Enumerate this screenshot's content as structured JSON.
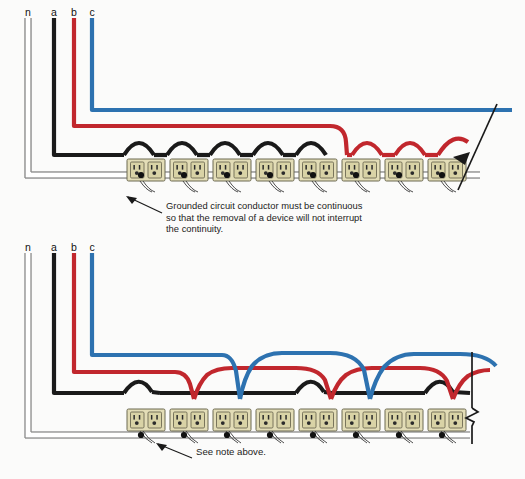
{
  "figure": {
    "background_color": "#fbfbfa"
  },
  "colors": {
    "phase_a_black": "#1a1a1a",
    "phase_b_red": "#c1272d",
    "phase_c_blue": "#2d72b0",
    "neutral_white": "#ffffff",
    "neutral_outline": "#8e8e8e",
    "receptacle_body": "#e3ddb7",
    "receptacle_outline": "#6d6a52",
    "receptacle_face": "#d8d2a4",
    "text": "#1b1b1b"
  },
  "conductor_labels": [
    {
      "id": "n",
      "label": "n",
      "name": "neutral",
      "color": "#ffffff"
    },
    {
      "id": "a",
      "label": "a",
      "name": "phase-a",
      "color": "#1a1a1a"
    },
    {
      "id": "b",
      "label": "b",
      "name": "phase-b",
      "color": "#c1272d"
    },
    {
      "id": "c",
      "label": "c",
      "name": "phase-c",
      "color": "#2d72b0"
    }
  ],
  "diagrams": [
    {
      "id": "top",
      "name": "top-diagram",
      "description": "All receptacles on one phase then next phase",
      "receptacle_count": 8,
      "receptacle_phases": [
        "a",
        "a",
        "a",
        "a",
        "a",
        "b",
        "b",
        "b"
      ],
      "note": "Grounded circuit conductor must be continuous\nso that the removal of a device will not interrupt\nthe continuity.",
      "has_break_symbol": true,
      "break_symbol": "diagonal-slash"
    },
    {
      "id": "bottom",
      "name": "bottom-diagram",
      "description": "Receptacles alternate across three phases",
      "receptacle_count": 8,
      "receptacle_phases": [
        "a",
        "b",
        "c",
        "a",
        "b",
        "c",
        "a",
        "b"
      ],
      "note": "See note above.",
      "has_break_symbol": true,
      "break_symbol": "vertical-zigzag"
    }
  ],
  "labels": {
    "top_conductors": [
      "n",
      "a",
      "b",
      "c"
    ],
    "bottom_conductors": [
      "n",
      "a",
      "b",
      "c"
    ]
  }
}
